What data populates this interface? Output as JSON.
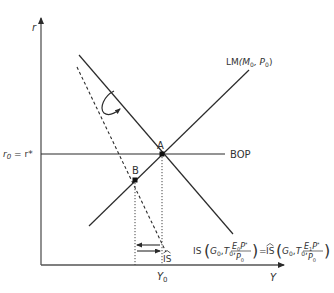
{
  "diagram": {
    "type": "IS-LM-BOP",
    "axes": {
      "y_label": "r",
      "x_label": "Y"
    },
    "curves": {
      "lm": {
        "label_main": "LM",
        "label_args": "(M",
        "sub0": "0",
        "comma_p": ", P",
        "sub1": "0",
        "close": ")"
      },
      "bop": {
        "label": "BOP"
      },
      "is_hat": {
        "label": "IS"
      }
    },
    "rate_label": {
      "r": "r",
      "sub": "0",
      "eq": " = r*"
    },
    "points": [
      {
        "label": "A"
      },
      {
        "label": "B"
      }
    ],
    "income_label": {
      "main": "Y",
      "sub": "0"
    },
    "equation": {
      "lhs": "IS",
      "rhs": "IS",
      "g": "G",
      "t": "T",
      "zero": "0",
      "comma": ",",
      "eq": "=",
      "e0": "E",
      "e1": "E",
      "one": "1",
      "pstar": "P",
      "star": "*",
      "p": "P"
    },
    "colors": {
      "line": "#2b2b2b",
      "text": "#333333"
    }
  }
}
